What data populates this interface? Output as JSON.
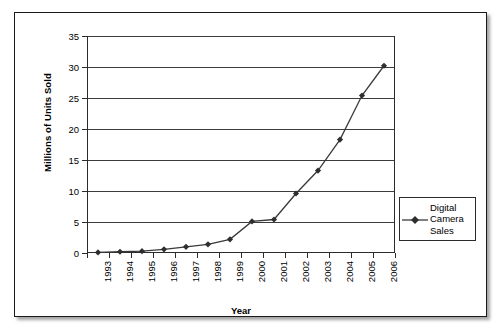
{
  "chart_data": {
    "type": "line",
    "title": "",
    "xlabel": "Year",
    "ylabel": "Millions of Units Sold",
    "categories": [
      "1993",
      "1994",
      "1995",
      "1996",
      "1997",
      "1998",
      "1999",
      "2000",
      "2001",
      "2002",
      "2003",
      "2004",
      "2005",
      "2006"
    ],
    "series": [
      {
        "name": "Digital Camera Sales",
        "values": [
          0.1,
          0.2,
          0.3,
          0.6,
          1.0,
          1.4,
          2.2,
          5.1,
          5.4,
          9.6,
          13.3,
          18.3,
          25.4,
          30.2
        ],
        "marker": "diamond",
        "color": "#3a3a3a"
      }
    ],
    "ylim": [
      0,
      35
    ],
    "yticks": [
      0,
      5,
      10,
      15,
      20,
      25,
      30,
      35
    ],
    "ytick_labels": [
      "0",
      "5",
      "10",
      "15",
      "20",
      "25",
      "30",
      "35"
    ],
    "grid": "horizontal",
    "legend_position": "right",
    "legend_entries": [
      "Digital Camera Sales"
    ],
    "xtick_rotation": -90
  },
  "legend": {
    "entry_label": "Digital Camera Sales"
  },
  "axes": {
    "y_title": "Millions of Units Sold",
    "x_title": "Year"
  }
}
